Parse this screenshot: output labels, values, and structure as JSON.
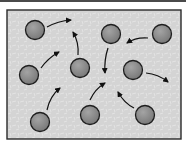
{
  "diagram": {
    "colors": {
      "background": "#d6d6d6",
      "frame_border": "#2a2a2a",
      "particle_fill": "#8a8a8a",
      "particle_stroke": "#1e1e1e",
      "arrow": "#111111"
    },
    "particles": [
      {
        "id": 1,
        "cx": 35,
        "cy": 30,
        "r": 9.5
      },
      {
        "id": 2,
        "cx": 111,
        "cy": 34,
        "r": 9.5
      },
      {
        "id": 3,
        "cx": 162,
        "cy": 34,
        "r": 9.5
      },
      {
        "id": 4,
        "cx": 29,
        "cy": 75,
        "r": 9.5
      },
      {
        "id": 5,
        "cx": 80,
        "cy": 68,
        "r": 9.5
      },
      {
        "id": 6,
        "cx": 133,
        "cy": 70,
        "r": 9.5
      },
      {
        "id": 7,
        "cx": 40,
        "cy": 122,
        "r": 9.5
      },
      {
        "id": 8,
        "cx": 90,
        "cy": 115,
        "r": 9.5
      },
      {
        "id": 9,
        "cx": 145,
        "cy": 115,
        "r": 9.5
      }
    ],
    "arrows": [
      {
        "from_particle": 1,
        "path": "M47,27 Q58,21 71,20"
      },
      {
        "from_particle": 4,
        "path": "M41,68 Q48,58 59,52"
      },
      {
        "from_particle": 5,
        "path": "M78,55 Q79,42 73,32"
      },
      {
        "from_particle": 3,
        "path": "M148,38 Q136,37 127,43"
      },
      {
        "from_particle": 2,
        "path": "M108,48 Q104,60 105,73"
      },
      {
        "from_particle": 6,
        "path": "M146,73 Q158,74 168,82"
      },
      {
        "from_particle": 7,
        "path": "M47,110 Q50,96 60,88"
      },
      {
        "from_particle": 8,
        "path": "M90,100 Q95,89 105,83"
      },
      {
        "from_particle": 9,
        "path": "M134,108 Q124,103 118,92"
      }
    ]
  }
}
